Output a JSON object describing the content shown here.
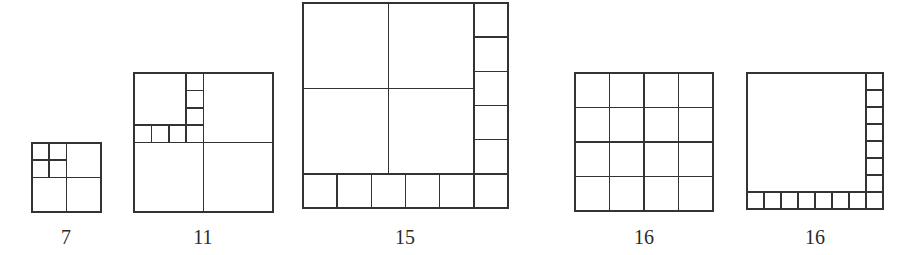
{
  "diagram": {
    "stroke_color": "#333333",
    "background": "#ffffff",
    "figures": [
      {
        "label": "7",
        "n_squares": 7,
        "box": {
          "x": 32,
          "y": 143,
          "size": 69
        },
        "description": "2x2 grid where the top-left quadrant is subdivided into 4 smaller squares"
      },
      {
        "label": "11",
        "n_squares": 11,
        "box": {
          "x": 134,
          "y": 73,
          "size": 139
        },
        "description": "2x2 grid where the top-left quadrant holds one large square plus an L-strip of 4+3 small squares"
      },
      {
        "label": "15",
        "n_squares": 15,
        "box": {
          "x": 303,
          "y": 3,
          "size": 205
        },
        "description": "6x6 layout: 4 large squares (each 5/2 x 5/2 units) with a bottom row of 6 and right column of 5 unit squares"
      },
      {
        "label": "16",
        "n_squares": 16,
        "box": {
          "x": 575,
          "y": 73,
          "size": 138
        },
        "description": "Uniform 4x4 grid"
      },
      {
        "label": "16",
        "n_squares": 16,
        "box": {
          "x": 747,
          "y": 73,
          "size": 136
        },
        "description": "One large 7x7 square with a bottom row of 8 and right column of 7 unit squares (8x8 layout)"
      }
    ]
  }
}
